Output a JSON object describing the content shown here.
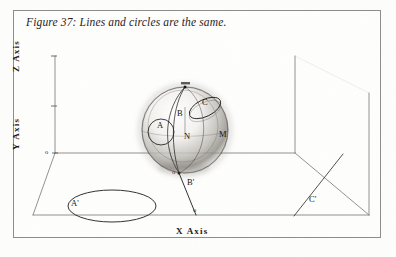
{
  "figure": {
    "caption": "Figure 37: Lines and circles are the same.",
    "border_color": "#8e8d88",
    "ink_color": "#1c1a18",
    "page_color": "#fdfdfc"
  },
  "axes": {
    "z_label": "Z  Axis",
    "y_label": "Y  Axis",
    "x_label": "X  Axis",
    "origin_marks": [
      "o",
      "o",
      "o"
    ],
    "z_tick_top": "1",
    "z_tick_mid": "1"
  },
  "sphere": {
    "description": "shaded sphere centred on origin",
    "labels": [
      {
        "id": "label-A",
        "text": "A"
      },
      {
        "id": "label-B",
        "text": "B"
      },
      {
        "id": "label-C",
        "text": "C"
      },
      {
        "id": "label-N",
        "text": "N"
      },
      {
        "id": "label-M",
        "text": "M"
      }
    ],
    "pole_top": "o",
    "pole_bottom": "o"
  },
  "ground_plane": {
    "labels": [
      {
        "id": "label-A-prime",
        "text": "A'"
      },
      {
        "id": "label-B-prime",
        "text": "B'"
      },
      {
        "id": "label-C-prime",
        "text": "C'"
      }
    ]
  }
}
